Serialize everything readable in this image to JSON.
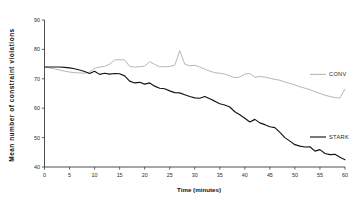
{
  "chart_data": {
    "type": "line",
    "title": "",
    "xlabel": "Time (minutes)",
    "ylabel": "Mean number of constraint violations",
    "xlim": [
      0,
      60
    ],
    "ylim": [
      40,
      90
    ],
    "xticks": [
      0,
      5,
      10,
      15,
      20,
      25,
      30,
      35,
      40,
      45,
      50,
      55,
      60
    ],
    "yticks": [
      40,
      50,
      60,
      70,
      80,
      90
    ],
    "grid": false,
    "legend_position": "right-inline",
    "series": [
      {
        "name": "CONV",
        "color": "#a9a9a9",
        "label_x": 60,
        "label_y": 71.5,
        "x": [
          0,
          1,
          2,
          3,
          4,
          5,
          6,
          7,
          8,
          9,
          10,
          11,
          12,
          13,
          14,
          15,
          16,
          17,
          18,
          19,
          20,
          21,
          22,
          23,
          24,
          25,
          26,
          27,
          28,
          29,
          30,
          31,
          32,
          33,
          34,
          35,
          36,
          37,
          38,
          39,
          40,
          41,
          42,
          43,
          44,
          45,
          46,
          47,
          48,
          49,
          50,
          51,
          52,
          53,
          54,
          55,
          56,
          57,
          58,
          59,
          60
        ],
        "y": [
          74.0,
          73.7,
          73.4,
          73.0,
          72.6,
          72.3,
          72.1,
          72.0,
          71.9,
          72.3,
          73.6,
          74.0,
          74.2,
          75.0,
          76.4,
          76.5,
          76.4,
          74.2,
          74.0,
          74.1,
          74.3,
          75.8,
          74.9,
          74.1,
          74.1,
          74.2,
          74.6,
          79.6,
          75.0,
          74.4,
          74.6,
          74.0,
          73.3,
          72.6,
          72.1,
          71.9,
          71.6,
          71.0,
          70.4,
          70.6,
          71.6,
          71.8,
          70.5,
          70.8,
          70.6,
          70.2,
          69.8,
          69.5,
          68.9,
          68.4,
          67.9,
          67.3,
          66.8,
          66.3,
          65.6,
          65.0,
          64.4,
          64.0,
          63.6,
          63.5,
          66.5
        ]
      },
      {
        "name": "STARK",
        "color": "#141414",
        "label_x": 60,
        "label_y": 50.2,
        "x": [
          0,
          1,
          2,
          3,
          4,
          5,
          6,
          7,
          8,
          9,
          10,
          11,
          12,
          13,
          14,
          15,
          16,
          17,
          18,
          19,
          20,
          21,
          22,
          23,
          24,
          25,
          26,
          27,
          28,
          29,
          30,
          31,
          32,
          33,
          34,
          35,
          36,
          37,
          38,
          39,
          40,
          41,
          42,
          43,
          44,
          45,
          46,
          47,
          48,
          49,
          50,
          51,
          52,
          53,
          54,
          55,
          56,
          57,
          58,
          59,
          60
        ],
        "y": [
          74.0,
          74.0,
          74.0,
          74.0,
          73.9,
          73.7,
          73.4,
          73.0,
          72.5,
          71.8,
          72.6,
          71.5,
          71.9,
          71.6,
          71.8,
          71.7,
          71.0,
          69.2,
          68.6,
          68.8,
          68.2,
          68.6,
          67.5,
          66.8,
          66.6,
          65.9,
          65.3,
          65.2,
          64.6,
          64.0,
          63.5,
          63.4,
          64.0,
          63.2,
          62.4,
          61.5,
          61.1,
          60.4,
          58.8,
          57.8,
          56.6,
          55.3,
          56.2,
          55.0,
          54.4,
          53.7,
          53.4,
          51.8,
          50.0,
          48.8,
          47.6,
          47.1,
          46.8,
          46.9,
          45.4,
          45.9,
          44.6,
          44.2,
          44.3,
          43.3,
          42.5
        ]
      }
    ]
  },
  "legend": {
    "conv_label": "CONV",
    "stark_label": "STARK"
  },
  "axes": {
    "x_title": "Time (minutes)",
    "y_title": "Mean number of constraint violations",
    "x_tick_labels": [
      "0",
      "5",
      "10",
      "15",
      "20",
      "25",
      "30",
      "35",
      "40",
      "45",
      "50",
      "55",
      "60"
    ],
    "y_tick_labels": [
      "40",
      "50",
      "60",
      "70",
      "80",
      "90"
    ]
  }
}
